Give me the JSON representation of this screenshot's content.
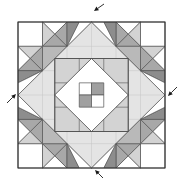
{
  "illustration": {
    "description": "quilt block pattern with corner stars, central diamond-in-square and four direction arrows",
    "canvas": {
      "width": 179,
      "height": 181
    },
    "quilt": {
      "x": 18,
      "y": 22,
      "width": 147,
      "height": 146,
      "grid_cells": 6
    },
    "colors": {
      "background": "#ffffff",
      "white": "#ffffff",
      "big_diamond": "#e4e4e4",
      "light": "#d3d3d3",
      "ring": "#d3d3d3",
      "medium": "#b9b9b9",
      "med_dark": "#a8a8a8",
      "dark": "#8d8d8d",
      "checker_dark": "#a0a0a0",
      "piece_line": "#555555",
      "block_line": "#4a4a4a",
      "border_line": "#2f2f2f",
      "grid_line": "#c4c4c4",
      "arrow": "#1a1a1a"
    },
    "center_checkerboard": {
      "pattern": [
        [
          "white",
          "dark"
        ],
        [
          "dark",
          "white"
        ]
      ]
    },
    "arrows": [
      {
        "name": "top",
        "tail": [
          104,
          4
        ],
        "head": [
          94,
          11
        ]
      },
      {
        "name": "right",
        "tail": [
          177,
          87
        ],
        "head": [
          168,
          96
        ]
      },
      {
        "name": "bottom",
        "tail": [
          103,
          178
        ],
        "head": [
          95,
          170
        ]
      },
      {
        "name": "left",
        "tail": [
          7,
          103
        ],
        "head": [
          16,
          94
        ]
      }
    ]
  }
}
